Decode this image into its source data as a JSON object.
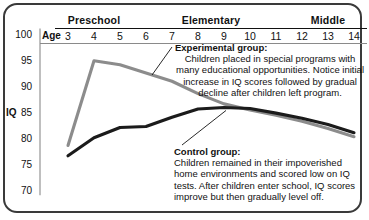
{
  "chart_data": {
    "type": "line",
    "title": "",
    "xlabel": "Age",
    "ylabel": "IQ",
    "x": [
      3,
      4,
      5,
      6,
      7,
      8,
      9,
      10,
      11,
      12,
      13,
      14
    ],
    "xlim": [
      3,
      14
    ],
    "ylim": [
      70,
      100
    ],
    "yticks": [
      100,
      95,
      90,
      85,
      80,
      75,
      70
    ],
    "xticks": [
      "3",
      "4",
      "5",
      "6",
      "7",
      "8",
      "9",
      "10",
      "11",
      "12",
      "13",
      "14"
    ],
    "grid": false,
    "legend": "annotations",
    "series": [
      {
        "name": "Experimental group",
        "color": "#8c8c8c",
        "values": [
          78.5,
          95.0,
          94.2,
          92.6,
          91.0,
          88.6,
          86.6,
          85.4,
          84.4,
          83.2,
          81.8,
          80.2
        ]
      },
      {
        "name": "Control group",
        "color": "#1b1b1b",
        "values": [
          76.5,
          80.0,
          82.0,
          82.2,
          84.0,
          85.6,
          85.9,
          85.7,
          84.8,
          83.8,
          82.6,
          81.0
        ]
      }
    ],
    "band_groups": [
      {
        "label": "Preschool",
        "from": 3,
        "to": 5
      },
      {
        "label": "Elementary",
        "from": 6,
        "to": 11
      },
      {
        "label": "Middle",
        "from": 12,
        "to": 14
      }
    ],
    "annotations": [
      {
        "id": "experimental",
        "header": "Experimental group:",
        "body": "Children placed in special programs with many educational opportunities. Notice initial increase in IQ scores followed by gradual decline after children left program."
      },
      {
        "id": "control",
        "header": "Control group:",
        "body": "Children remained in their impoverished home environments and scored low on IQ tests. After children enter school, IQ scores improve but then gradually level off."
      }
    ]
  },
  "axes": {
    "age_word": "Age",
    "iq_word": "IQ"
  },
  "colors": {
    "frame": "#3a3a3a",
    "experimental": "#8c8c8c",
    "control": "#1b1b1b",
    "text": "#111111",
    "background": "#ffffff"
  }
}
